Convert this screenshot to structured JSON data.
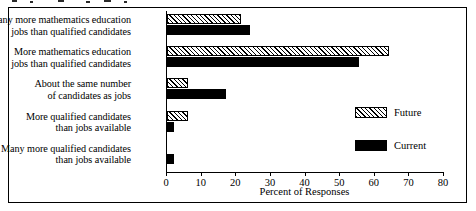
{
  "chart_data": {
    "type": "bar",
    "orientation": "horizontal",
    "title": "",
    "xlabel": "Percent of Responses",
    "ylabel": "",
    "xlim": [
      0,
      80
    ],
    "xticks": [
      0,
      10,
      20,
      30,
      40,
      50,
      60,
      70,
      80
    ],
    "grid": false,
    "legend_position": "center-right",
    "categories": [
      "Many more mathematics education\njobs than qualified candidates",
      "More mathematics education\njobs than qualified candidates",
      "About the same number\nof candidates as jobs",
      "More qualified candidates\nthan jobs available",
      "Many more qualified candidates\nthan jobs available"
    ],
    "category_lines": [
      [
        "Many more mathematics education",
        "jobs than qualified candidates"
      ],
      [
        "More mathematics education",
        "jobs than qualified candidates"
      ],
      [
        "About the same number",
        "of candidates as jobs"
      ],
      [
        "More qualified candidates",
        "than jobs available"
      ],
      [
        "Many more qualified candidates",
        "than jobs available"
      ]
    ],
    "series": [
      {
        "name": "Future",
        "fill": "hatched",
        "color": "#ffffff",
        "edge_color": "#000000",
        "values": [
          21.5,
          64,
          6,
          6,
          0
        ]
      },
      {
        "name": "Current",
        "fill": "solid",
        "color": "#000000",
        "edge_color": "#000000",
        "values": [
          24,
          55.5,
          17,
          2,
          2
        ]
      }
    ]
  },
  "axis": {
    "x_title": "Percent of Responses",
    "tick_labels": [
      "0",
      "10",
      "20",
      "30",
      "40",
      "50",
      "60",
      "70",
      "80"
    ]
  },
  "legend": {
    "entries": [
      {
        "label": "Future"
      },
      {
        "label": "Current"
      }
    ]
  },
  "colors": {
    "ink": "#000000",
    "paper": "#ffffff"
  }
}
